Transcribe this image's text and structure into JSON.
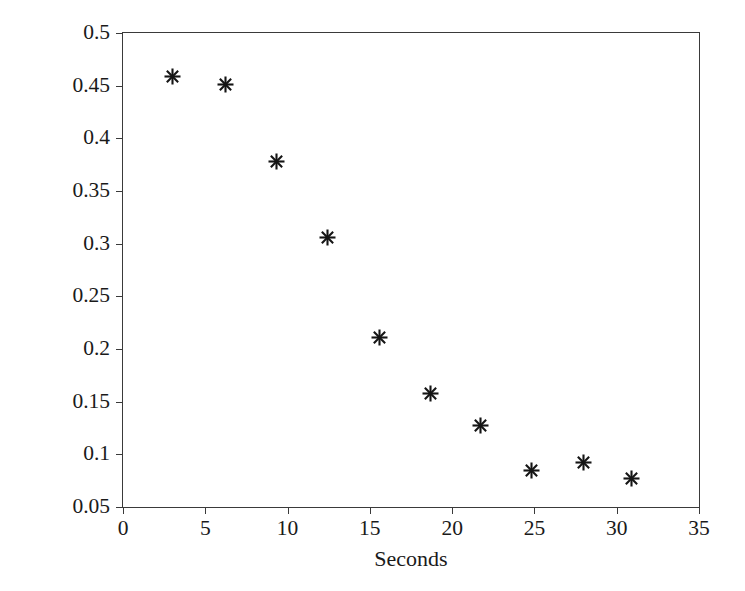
{
  "chart_data": {
    "type": "scatter",
    "title": "",
    "xlabel": "Seconds",
    "ylabel": "Entropy Level",
    "xlim": [
      0,
      35
    ],
    "ylim": [
      0.05,
      0.5
    ],
    "xticks": [
      "0",
      "5",
      "10",
      "15",
      "20",
      "25",
      "30",
      "35"
    ],
    "xtick_values": [
      0,
      5,
      10,
      15,
      20,
      25,
      30,
      35
    ],
    "yticks": [
      "0.05",
      "0.1",
      "0.15",
      "0.2",
      "0.25",
      "0.3",
      "0.35",
      "0.4",
      "0.45",
      "0.5"
    ],
    "ytick_values": [
      0.05,
      0.1,
      0.15,
      0.2,
      0.25,
      0.3,
      0.35,
      0.4,
      0.45,
      0.5
    ],
    "grid": false,
    "legend": false,
    "marker": "asterisk",
    "marker_color": "#151515",
    "axis_color": "#3a3a3a",
    "background": "#ffffff",
    "x": [
      3.0,
      6.2,
      9.3,
      12.4,
      15.6,
      18.7,
      21.7,
      24.8,
      28.0,
      30.9
    ],
    "values": [
      0.459,
      0.451,
      0.378,
      0.306,
      0.211,
      0.158,
      0.127,
      0.085,
      0.092,
      0.077
    ],
    "points": [
      {
        "x": 3.0,
        "y": 0.459
      },
      {
        "x": 6.2,
        "y": 0.451
      },
      {
        "x": 9.3,
        "y": 0.378
      },
      {
        "x": 12.4,
        "y": 0.306
      },
      {
        "x": 15.6,
        "y": 0.211
      },
      {
        "x": 18.7,
        "y": 0.158
      },
      {
        "x": 21.7,
        "y": 0.127
      },
      {
        "x": 24.8,
        "y": 0.085
      },
      {
        "x": 28.0,
        "y": 0.092
      },
      {
        "x": 30.9,
        "y": 0.077
      }
    ]
  }
}
